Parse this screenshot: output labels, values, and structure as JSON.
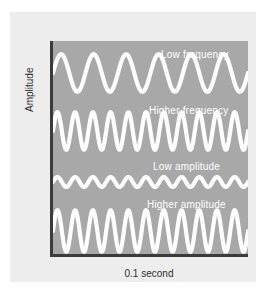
{
  "figure": {
    "background_color": "#ededed",
    "page_color": "#ffffff",
    "plot_background_color": "#a8a8a8",
    "wave_color": "#fdfdfd",
    "axis_color": "#3b3b3b"
  },
  "axes": {
    "y_title": "Amplitude",
    "x_title": "0.1 second"
  },
  "chart_data": {
    "type": "line",
    "title": "",
    "xlabel": "0.1 second",
    "ylabel": "Amplitude",
    "grid": false,
    "legend": "none",
    "xlim": [
      0,
      0.1
    ],
    "annotations": [
      "Low frequency",
      "Higher frequency",
      "Low amplitude",
      "Higher amplitude"
    ],
    "series": [
      {
        "name": "Low frequency",
        "label": "Low frequency",
        "waveform": "sine",
        "cycles": 6,
        "amplitude_rel": 1.0,
        "label_x_frac": 0.55,
        "row_top": 10,
        "row_height": 44,
        "label_top": 8,
        "label_left": 108
      },
      {
        "name": "Higher frequency",
        "label": "Higher frequency",
        "waveform": "sine",
        "cycles": 11,
        "amplitude_rel": 1.0,
        "label_x_frac": 0.47,
        "row_top": 68,
        "row_height": 44,
        "label_top": 64,
        "label_left": 96
      },
      {
        "name": "Low amplitude",
        "label": "Low amplitude",
        "waveform": "sine",
        "cycles": 11,
        "amplitude_rel": 0.42,
        "label_x_frac": 0.46,
        "row_top": 126,
        "row_height": 30,
        "label_top": 120,
        "label_left": 100
      },
      {
        "name": "Higher amplitude",
        "label": "Higher amplitude",
        "waveform": "sine",
        "cycles": 11,
        "amplitude_rel": 1.35,
        "label_x_frac": 0.45,
        "row_top": 166,
        "row_height": 48,
        "label_top": 158,
        "label_left": 94
      }
    ]
  }
}
